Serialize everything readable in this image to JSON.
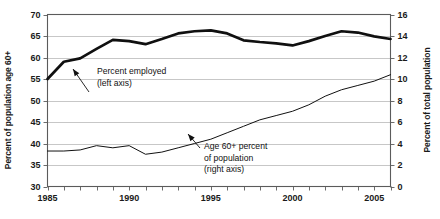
{
  "chart_data": {
    "type": "line",
    "title": "",
    "subtitle": "",
    "xlabel": "",
    "ylabel": "Percent of population age 60+",
    "y2label": "Percent of total population",
    "xlim": [
      1985,
      2006
    ],
    "ylim": [
      30,
      70
    ],
    "y2lim": [
      0,
      16
    ],
    "grid": true,
    "legend_position": "inline-annotations",
    "x_tick_labels": [
      "1985",
      "1990",
      "1995",
      "2000",
      "2005"
    ],
    "x_tick_values": [
      1985,
      1990,
      1995,
      2000,
      2005
    ],
    "x_minor_tick_values": [
      1985,
      1986,
      1987,
      1988,
      1989,
      1990,
      1991,
      1992,
      1993,
      1994,
      1995,
      1996,
      1997,
      1998,
      1999,
      2000,
      2001,
      2002,
      2003,
      2004,
      2005,
      2006
    ],
    "y_tick_labels": [
      "30",
      "35",
      "40",
      "45",
      "50",
      "55",
      "60",
      "65",
      "70"
    ],
    "y_tick_values": [
      30,
      35,
      40,
      45,
      50,
      55,
      60,
      65,
      70
    ],
    "y2_tick_labels": [
      "0",
      "2",
      "4",
      "6",
      "8",
      "10",
      "12",
      "14",
      "16"
    ],
    "y2_tick_values": [
      0,
      2,
      4,
      6,
      8,
      10,
      12,
      14,
      16
    ],
    "x": [
      1985,
      1986,
      1987,
      1988,
      1989,
      1990,
      1991,
      1992,
      1993,
      1994,
      1995,
      1996,
      1997,
      1998,
      1999,
      2000,
      2001,
      2002,
      2003,
      2004,
      2005,
      2006
    ],
    "series": [
      {
        "name": "Percent employed",
        "axis": "left",
        "style": "thick",
        "color": "#101010",
        "values": [
          55.0,
          59.0,
          59.8,
          62.0,
          64.1,
          63.8,
          63.1,
          64.3,
          65.6,
          66.1,
          66.3,
          65.6,
          64.0,
          63.6,
          63.3,
          62.8,
          63.8,
          65.0,
          66.1,
          65.8,
          64.9,
          64.3
        ]
      },
      {
        "name": "Age 60+ percent of population",
        "axis": "right",
        "style": "thin",
        "color": "#111111",
        "values": [
          3.3,
          3.3,
          3.4,
          3.8,
          3.6,
          3.8,
          3.0,
          3.2,
          3.6,
          4.0,
          4.4,
          5.0,
          5.6,
          6.2,
          6.6,
          7.0,
          7.6,
          8.4,
          9.0,
          9.4,
          9.8,
          10.4
        ]
      }
    ],
    "annotations": [
      {
        "id": "percent-employed",
        "lines": [
          "Percent employed",
          "(left axis)"
        ],
        "text_x": 97,
        "text_y": 74,
        "arrow_from_x": 89,
        "arrow_from_y": 92,
        "arrow_to_x": 73,
        "arrow_to_y": 69
      },
      {
        "id": "age-60-plus",
        "lines": [
          "Age 60+ percent",
          "of population",
          "(right axis)"
        ],
        "text_x": 204,
        "text_y": 149,
        "arrow_from_x": 200,
        "arrow_from_y": 148,
        "arrow_to_x": 188,
        "arrow_to_y": 134
      }
    ]
  }
}
